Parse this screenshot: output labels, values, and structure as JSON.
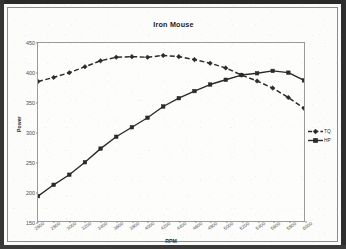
{
  "figure": {
    "title": "Iron Mouse",
    "legend_position": "right"
  },
  "axes": {
    "ylabel": "Power",
    "xlabel": "RPM",
    "yticks": [
      "450",
      "400",
      "350",
      "300",
      "250",
      "200",
      "150"
    ],
    "xticks": [
      "2600",
      "2800",
      "3000",
      "3200",
      "3400",
      "3600",
      "3800",
      "4000",
      "4200",
      "4400",
      "4600",
      "4800",
      "5000",
      "5200",
      "5400",
      "5600",
      "5800",
      "6000"
    ]
  },
  "legend": {
    "entries": [
      {
        "label": "TQ",
        "marker": "diamond",
        "style": "dashed",
        "color": "#2b2b2b"
      },
      {
        "label": "HP",
        "marker": "square",
        "style": "solid",
        "color": "#2b2b2b"
      }
    ]
  },
  "colors": {
    "line": "#2b2b2b",
    "axis": "#9b9b9b",
    "text": "#2b2b2b",
    "page": "#fbfbfa",
    "border": "#2a2a2a"
  },
  "chart_data": {
    "type": "line",
    "title": "Iron Mouse",
    "xlabel": "RPM",
    "ylabel": "Power",
    "xlim": [
      2600,
      6000
    ],
    "ylim": [
      150,
      450
    ],
    "ytick_step": 50,
    "xtick_step": 200,
    "grid": false,
    "legend_position": "right",
    "x": [
      2600,
      2800,
      3000,
      3200,
      3400,
      3600,
      3800,
      4000,
      4200,
      4400,
      4600,
      4800,
      5000,
      5200,
      5400,
      5600,
      5800,
      6000
    ],
    "series": [
      {
        "name": "TQ",
        "marker": "diamond",
        "linestyle": "dashed",
        "values": [
          385,
          392,
          400,
          410,
          420,
          426,
          427,
          426,
          429,
          427,
          422,
          416,
          408,
          396,
          386,
          374,
          358,
          340
        ]
      },
      {
        "name": "HP",
        "marker": "square",
        "linestyle": "solid",
        "values": [
          192,
          211,
          228,
          249,
          272,
          292,
          308,
          324,
          343,
          357,
          369,
          380,
          388,
          396,
          399,
          403,
          400,
          387
        ]
      }
    ],
    "annotations": [
      "Curves cross near 5200 RPM at approximately 396"
    ]
  }
}
